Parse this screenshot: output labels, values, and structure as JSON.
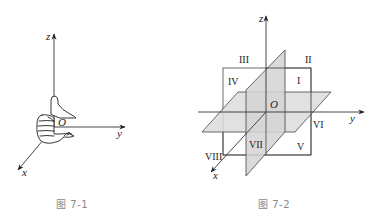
{
  "figures": [
    {
      "id": "fig-7-1",
      "caption": "图 7-1",
      "axes": {
        "x": "x",
        "y": "y",
        "z": "z",
        "origin": "O"
      },
      "illustration": "right-hand-rule"
    },
    {
      "id": "fig-7-2",
      "caption": "图 7-2",
      "axes": {
        "x": "x",
        "y": "y",
        "z": "z",
        "origin": "O"
      },
      "octants": [
        "I",
        "II",
        "III",
        "IV",
        "V",
        "VI",
        "VII",
        "VIII"
      ]
    }
  ],
  "colors": {
    "line": "#333333",
    "plane_fill": "#d9d9d9",
    "caption": "#888888"
  }
}
